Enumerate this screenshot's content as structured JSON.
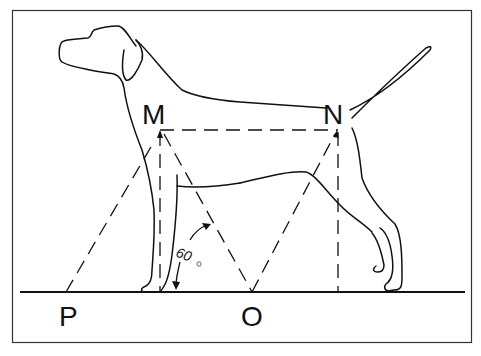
{
  "figure": {
    "labels": {
      "M": "M",
      "N": "N",
      "P": "P",
      "O": "O"
    },
    "angle": {
      "value": "60",
      "unit": "°"
    },
    "colors": {
      "stroke": "#111111",
      "background": "#ffffff",
      "frame": "#333333"
    }
  }
}
